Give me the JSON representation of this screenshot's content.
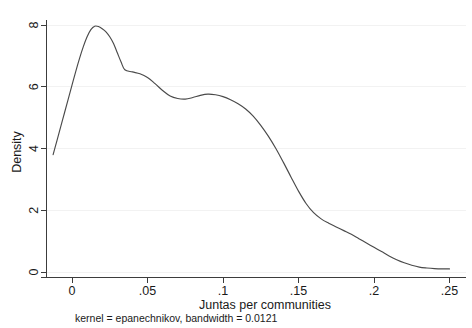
{
  "chart_data": {
    "type": "line",
    "title": "",
    "subtitle": "kernel = epanechnikov, bandwidth = 0.0121",
    "xlabel": "Juntas per communities",
    "ylabel": "Density",
    "xlim": [
      -0.0255,
      0.2565
    ],
    "ylim": [
      0,
      8.45
    ],
    "xticks": [
      0,
      0.05,
      0.1,
      0.15,
      0.2,
      0.25
    ],
    "xticklabels": [
      "0",
      ".05",
      ".1",
      ".15",
      ".2",
      ".25"
    ],
    "yticks": [
      0,
      2,
      4,
      6,
      8
    ],
    "yticklabels": [
      "0",
      "2",
      "4",
      "6",
      "8"
    ],
    "grid": "horizontal-faint",
    "legend": "none",
    "series": [
      {
        "name": "Kernel density estimate",
        "x": [
          -0.0125,
          -0.01,
          -0.0075,
          -0.005,
          -0.0025,
          0.0,
          0.0025,
          0.005,
          0.0075,
          0.01,
          0.0125,
          0.015,
          0.0175,
          0.02,
          0.0225,
          0.025,
          0.0275,
          0.03,
          0.0325,
          0.035,
          0.04,
          0.045,
          0.05,
          0.055,
          0.06,
          0.065,
          0.07,
          0.075,
          0.08,
          0.085,
          0.09,
          0.095,
          0.1,
          0.105,
          0.11,
          0.115,
          0.12,
          0.125,
          0.13,
          0.135,
          0.14,
          0.145,
          0.15,
          0.155,
          0.16,
          0.165,
          0.17,
          0.175,
          0.18,
          0.185,
          0.19,
          0.195,
          0.2,
          0.205,
          0.21,
          0.215,
          0.22,
          0.225,
          0.23,
          0.235,
          0.24,
          0.245,
          0.25
        ],
        "y": [
          3.8,
          4.25,
          4.7,
          5.15,
          5.6,
          6.05,
          6.5,
          6.92,
          7.3,
          7.62,
          7.85,
          7.96,
          7.95,
          7.88,
          7.78,
          7.62,
          7.4,
          7.1,
          6.8,
          6.55,
          6.48,
          6.42,
          6.3,
          6.1,
          5.88,
          5.7,
          5.62,
          5.6,
          5.65,
          5.72,
          5.76,
          5.74,
          5.68,
          5.58,
          5.45,
          5.28,
          5.05,
          4.75,
          4.4,
          4.0,
          3.55,
          3.08,
          2.62,
          2.22,
          1.92,
          1.72,
          1.58,
          1.46,
          1.34,
          1.22,
          1.08,
          0.94,
          0.8,
          0.66,
          0.52,
          0.4,
          0.3,
          0.22,
          0.16,
          0.13,
          0.11,
          0.1,
          0.1
        ]
      }
    ]
  },
  "axes": {
    "ylabel": "Density",
    "xlabel": "Juntas per communities",
    "yticklabels": [
      "8",
      "6",
      "4",
      "2",
      "0"
    ],
    "xticklabels": [
      "0",
      ".05",
      ".1",
      ".15",
      ".2",
      ".25"
    ]
  },
  "footnote": {
    "text": "kernel = epanechnikov, bandwidth = 0.0121"
  }
}
